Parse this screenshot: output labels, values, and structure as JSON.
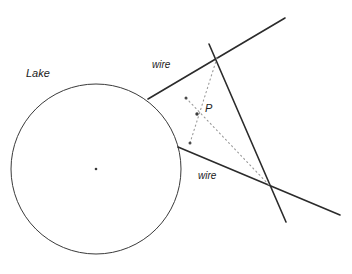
{
  "diagram": {
    "background_color": "#ffffff",
    "stroke_color": "#2b2b2b",
    "dotted_color": "#8a8a8a",
    "labels": {
      "lake": "Lake",
      "wire_upper": "wire",
      "wire_lower": "wire",
      "point_p": "P"
    },
    "circle": {
      "name": "lake-circle",
      "cx": 96,
      "cy": 169,
      "r": 85,
      "center_dot": {
        "cx": 96,
        "cy": 169,
        "r": 1.4
      }
    },
    "solid_lines": [
      {
        "name": "wire-upper-line",
        "x1": 148,
        "y1": 99,
        "x2": 285,
        "y2": 18
      },
      {
        "name": "wire-lower-line",
        "x1": 178,
        "y1": 147,
        "x2": 340,
        "y2": 215
      },
      {
        "name": "crossing-line",
        "x1": 209,
        "y1": 44,
        "x2": 286,
        "y2": 222
      }
    ],
    "dotted_lines": [
      {
        "name": "dotted-vertical-segment",
        "x1": 217,
        "y1": 58,
        "x2": 190,
        "y2": 143
      },
      {
        "name": "dotted-diagonal-segment",
        "x1": 186,
        "y1": 98,
        "x2": 271,
        "y2": 187
      }
    ],
    "points": [
      {
        "name": "point-p-dot",
        "cx": 197,
        "cy": 114,
        "r": 1.6
      },
      {
        "name": "point-upper-left-dot",
        "cx": 186,
        "cy": 98,
        "r": 1.4
      },
      {
        "name": "point-lower-dot",
        "cx": 190,
        "cy": 143,
        "r": 1.4
      }
    ]
  }
}
